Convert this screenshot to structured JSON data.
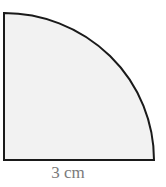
{
  "figure": {
    "shape": "quarter-circle",
    "fill_color": "#f2f2f2",
    "stroke_color": "#1a1a1a",
    "radius_label": "3 cm",
    "label_color": "#7a7a7a"
  }
}
